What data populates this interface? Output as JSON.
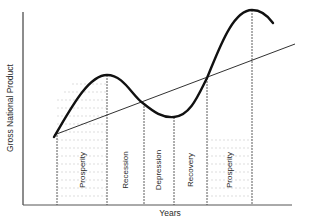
{
  "diagram": {
    "y_axis_label": "Gross National Product",
    "x_axis_label": "Years",
    "phases": [
      {
        "label": "Prosperity"
      },
      {
        "label": "Recession"
      },
      {
        "label": "Depression"
      },
      {
        "label": "Recovery"
      },
      {
        "label": "Prosperity"
      }
    ],
    "curves": {
      "cycle": "Business cycle (GNP fluctuation)",
      "trend": "Long-term growth trend line"
    },
    "colors": {
      "ink": "#1a1a1a",
      "shading": "#bdbdbd",
      "background": "#ffffff"
    }
  }
}
